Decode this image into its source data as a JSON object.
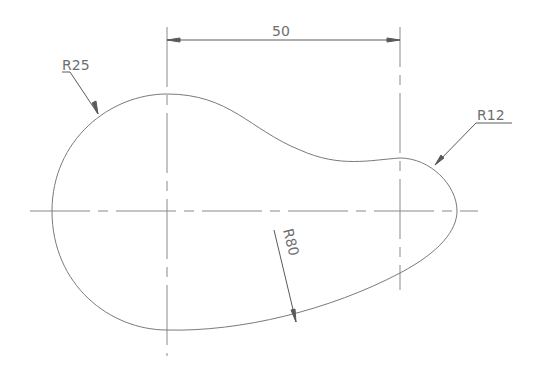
{
  "drawing": {
    "type": "2D CAD profile (cam shape) with centerlines and dimensions",
    "dimensions": {
      "horizontal": {
        "label": "50",
        "description": "distance between centers"
      },
      "radius_left": {
        "label": "R25"
      },
      "radius_right": {
        "label": "R12"
      },
      "radius_bottom": {
        "label": "R80"
      }
    },
    "colors": {
      "background": "#ffffff",
      "outline": "#7a7a7a",
      "centerline": "#8a8a8a",
      "dimension": "#5a5a5a",
      "text": "#6e6e6e"
    }
  }
}
